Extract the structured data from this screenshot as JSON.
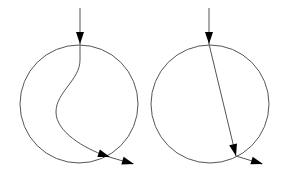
{
  "diagram": {
    "colors": {
      "line": "#555555",
      "arrow": "#000000",
      "background": "#ffffff"
    },
    "panels": [
      {
        "name": "curved-path",
        "circle": {
          "cx": 79,
          "cy": 104,
          "r": 59
        },
        "path": "M80,8 L80,60 C80,80 56,92 56,112 C56,132 84,148 106,156 L133,164",
        "arrowheads": [
          {
            "x": 80,
            "y": 44,
            "angle": 90
          },
          {
            "x": 110,
            "y": 157,
            "angle": 18
          },
          {
            "x": 134,
            "y": 164,
            "angle": 16
          }
        ]
      },
      {
        "name": "straight-path",
        "circle": {
          "cx": 210,
          "cy": 104,
          "r": 59
        },
        "path": "M209,8 L209,44 L236,156 L262,164",
        "arrowheads": [
          {
            "x": 209,
            "y": 44,
            "angle": 90
          },
          {
            "x": 236,
            "y": 156,
            "angle": 76
          },
          {
            "x": 263,
            "y": 164,
            "angle": 17
          }
        ]
      }
    ]
  }
}
